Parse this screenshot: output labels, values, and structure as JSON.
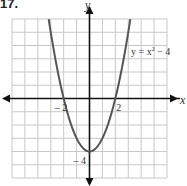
{
  "problem": {
    "number": "17."
  },
  "chart_data": {
    "type": "line",
    "title": "",
    "function": "y = x^2 - 4",
    "equation_label": {
      "base": "y = x",
      "exp": "2",
      "tail": " − 4"
    },
    "xlabel": "x",
    "ylabel": "y",
    "xlim": [
      -6,
      6
    ],
    "ylim": [
      -6,
      6
    ],
    "grid": true,
    "x_tick_labels": [
      {
        "value": -2,
        "text": "– 2"
      },
      {
        "value": 2,
        "text": "2"
      }
    ],
    "y_tick_labels": [
      {
        "value": -4,
        "text": "– 4"
      }
    ],
    "series": [
      {
        "name": "y = x² − 4",
        "x": [
          -3.16,
          -3,
          -2.5,
          -2,
          -1.5,
          -1,
          -0.5,
          0,
          0.5,
          1,
          1.5,
          2,
          2.5,
          3,
          3.16
        ],
        "y": [
          6,
          5,
          2.25,
          0,
          -1.75,
          -3,
          -3.75,
          -4,
          -3.75,
          -3,
          -1.75,
          0,
          2.25,
          5,
          6
        ]
      }
    ],
    "colors": {
      "curve": "#555555",
      "axes": "#111111",
      "grid": "#c8c8c8"
    }
  }
}
